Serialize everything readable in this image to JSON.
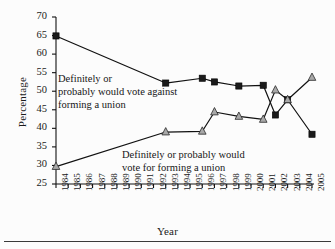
{
  "figure": {
    "background_color": "#fcfcfc",
    "line_color": "#111111",
    "square_marker_color": "#1a1a1a",
    "triangle_marker_color": "#a8a8a8"
  },
  "annotations": [
    {
      "id": "against",
      "lines": [
        "Definitely or",
        "probably would vote against",
        "forming a union"
      ]
    },
    {
      "id": "for",
      "lines": [
        "Definitely or probably would",
        "vote for forming a union"
      ]
    }
  ],
  "chart_data": {
    "type": "line",
    "title": "",
    "xlabel": "Year",
    "ylabel": "Percentage",
    "ylim": [
      25,
      70
    ],
    "yticks": [
      25,
      30,
      35,
      40,
      45,
      50,
      55,
      60,
      65,
      70
    ],
    "ytick_labels": [
      "25",
      "30",
      "35",
      "40",
      "45",
      "50",
      "55",
      "60",
      "65",
      "70"
    ],
    "xlim": [
      1984,
      2005
    ],
    "x": [
      1984,
      1985,
      1986,
      1987,
      1988,
      1989,
      1990,
      1991,
      1992,
      1993,
      1994,
      1995,
      1996,
      1997,
      1998,
      1999,
      2000,
      2001,
      2002,
      2003,
      2004,
      2005
    ],
    "xtick_labels": [
      "1984",
      "1985",
      "1986",
      "1987",
      "1988",
      "1989",
      "1990",
      "1991",
      "1992",
      "1993",
      "1994",
      "1995",
      "1996",
      "1997",
      "1998",
      "1999",
      "2000",
      "2001",
      "2002",
      "2003",
      "2004",
      "2005"
    ],
    "grid": false,
    "legend": "annotations-inline",
    "series": [
      {
        "name": "Definitely or probably would vote against forming a union",
        "marker": "square",
        "marker_color": "#1a1a1a",
        "points": [
          {
            "year": 1984,
            "value": 64.9
          },
          {
            "year": 1993,
            "value": 52.2
          },
          {
            "year": 1996,
            "value": 53.5
          },
          {
            "year": 1997,
            "value": 52.5
          },
          {
            "year": 1999,
            "value": 51.4
          },
          {
            "year": 2001,
            "value": 51.6
          },
          {
            "year": 2002,
            "value": 43.6
          },
          {
            "year": 2003,
            "value": 47.7
          },
          {
            "year": 2005,
            "value": 38.4
          }
        ]
      },
      {
        "name": "Definitely or probably would vote for forming a union",
        "marker": "triangle",
        "marker_color": "#a8a8a8",
        "points": [
          {
            "year": 1984,
            "value": 29.7
          },
          {
            "year": 1993,
            "value": 39.0
          },
          {
            "year": 1996,
            "value": 39.2
          },
          {
            "year": 1997,
            "value": 44.4
          },
          {
            "year": 1999,
            "value": 43.2
          },
          {
            "year": 2001,
            "value": 42.4
          },
          {
            "year": 2002,
            "value": 50.3
          },
          {
            "year": 2003,
            "value": 47.7
          },
          {
            "year": 2005,
            "value": 53.7
          }
        ]
      }
    ]
  }
}
